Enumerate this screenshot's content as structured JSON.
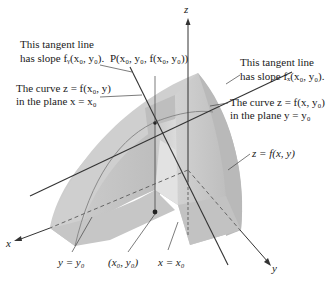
{
  "figure": {
    "type": "3D surface diagram: partial derivatives as slopes of tangent lines",
    "axes": {
      "x_label": "x",
      "y_label": "y",
      "z_label": "z"
    },
    "point_label": "P(x₀, y₀, f(x₀, y₀))",
    "base_point_label": "(x₀, y₀)",
    "surface_label": "z = f(x, y)",
    "plane_labels": {
      "y_plane": "y = y₀",
      "x_plane": "x = x₀"
    },
    "callouts": {
      "tangent_fy_line1": "This tangent line",
      "tangent_fy_line2": "has slope fᵧ(x₀, y₀).",
      "curve_x0_line1": "The curve z = f(x₀, y)",
      "curve_x0_line2": "in the plane x = x₀",
      "tangent_fx_line1": "This tangent line",
      "tangent_fx_line2": "has slope fₓ(x₀, y₀).",
      "curve_y0_line1": "The curve z = f(x, y₀)",
      "curve_y0_line2": "in the plane y = y₀"
    },
    "colors": {
      "surface_light": "#d6d6d6",
      "surface_mid": "#c4c4c4",
      "surface_dark": "#b0b0b0",
      "line": "#333333",
      "background": "#ffffff"
    }
  }
}
